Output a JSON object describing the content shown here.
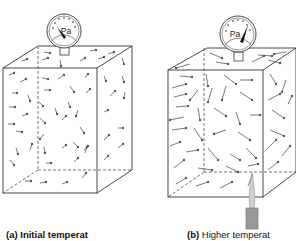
{
  "figure": {
    "colors": {
      "line": "#333333",
      "molecule": "#555555",
      "gauge_needle": "#111111",
      "flame": "#c8c8c8",
      "burner": "#9a9a9a"
    },
    "panels": [
      {
        "id": "a",
        "tag": "(a)",
        "caption": "Initial temperat",
        "gauge_label": "Pa",
        "needle_position": "low",
        "heat_source": false,
        "molecule_arrow_length": "short"
      },
      {
        "id": "b",
        "tag": "(b)",
        "caption": "Higher temperat",
        "gauge_label": "Pa",
        "needle_position": "high",
        "heat_source": true,
        "molecule_arrow_length": "long"
      }
    ]
  }
}
